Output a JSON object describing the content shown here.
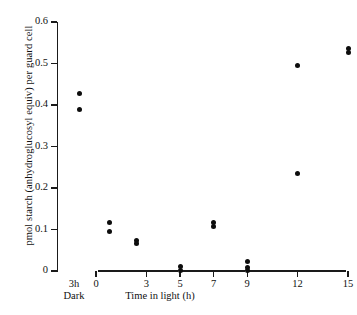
{
  "chart_data": {
    "type": "scatter",
    "title": "",
    "xlabel": "Time in light (h)",
    "ylabel": "pmol starch (anhydroglucosyl equiv) per guard cell",
    "xlim": [
      -1.5,
      16
    ],
    "ylim": [
      0,
      0.6
    ],
    "grid": false,
    "legend": null,
    "x_tick_labels": [
      "0",
      "3",
      "5",
      "7",
      "9",
      "12",
      "15"
    ],
    "x_tick_values": [
      0,
      3,
      5,
      7,
      9,
      12,
      15
    ],
    "y_tick_labels": [
      "0",
      "0.1",
      "0.2",
      "0.3",
      "0.4",
      "0.5",
      "0.6"
    ],
    "y_tick_values": [
      0,
      0.1,
      0.2,
      0.3,
      0.4,
      0.5,
      0.6
    ],
    "dark_category": {
      "label_line1": "3h",
      "label_line2": "Dark",
      "x_value": -1.0
    },
    "marker": "filled-circle",
    "marker_color": "#0d0d0d",
    "points": [
      {
        "x": -1.0,
        "y": 0.427
      },
      {
        "x": -1.0,
        "y": 0.388
      },
      {
        "x": 0.8,
        "y": 0.117
      },
      {
        "x": 0.8,
        "y": 0.094
      },
      {
        "x": 2.4,
        "y": 0.074
      },
      {
        "x": 2.4,
        "y": 0.066
      },
      {
        "x": 5.0,
        "y": 0.01
      },
      {
        "x": 5.0,
        "y": 0.002
      },
      {
        "x": 7.0,
        "y": 0.118
      },
      {
        "x": 7.0,
        "y": 0.107
      },
      {
        "x": 9.0,
        "y": 0.022
      },
      {
        "x": 9.0,
        "y": 0.008
      },
      {
        "x": 9.0,
        "y": 0.001
      },
      {
        "x": 12.0,
        "y": 0.495
      },
      {
        "x": 12.0,
        "y": 0.235
      },
      {
        "x": 15.0,
        "y": 0.537
      },
      {
        "x": 15.0,
        "y": 0.526
      }
    ]
  },
  "axes": {
    "y_title": "pmol starch (anhydroglucosyl equiv) per guard cell",
    "x_title": "Time in light (h)"
  }
}
